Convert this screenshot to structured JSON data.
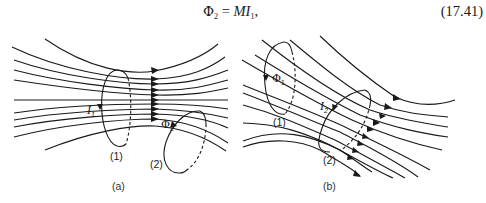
{
  "equation": {
    "lhs_symbol": "Φ",
    "lhs_subscript": "2",
    "equals": "=",
    "rhs_main": "MI",
    "rhs_subscript": "1",
    "trailing": ",",
    "number": "(17.41)"
  },
  "figure_a": {
    "caption": "(a)",
    "loop1_label": "(1)",
    "loop2_label": "(2)",
    "current_symbol": "I",
    "current_subscript": "1",
    "flux_symbol": "Φ",
    "flux_subscript": "2"
  },
  "figure_b": {
    "caption": "(b)",
    "loop1_label": "(1)",
    "loop2_label": "(2)",
    "current_symbol": "I",
    "current_subscript": "2",
    "flux_symbol": "Φ",
    "flux_subscript": "1"
  },
  "colors": {
    "line": "#1a1a1a",
    "background": "#ffffff"
  }
}
